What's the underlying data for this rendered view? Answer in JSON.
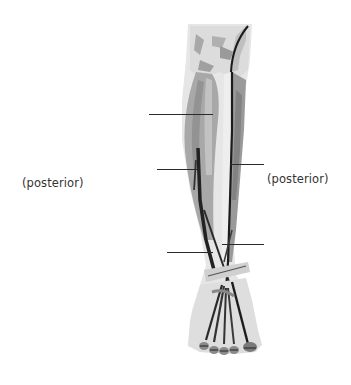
{
  "diagram": {
    "labels": [
      {
        "id": "left",
        "text": "(posterior)"
      },
      {
        "id": "right",
        "text": "(posterior)"
      }
    ],
    "leader_lines": [
      {
        "id": "line-1",
        "side": "left",
        "x1": 149,
        "x2": 213,
        "y": 114
      },
      {
        "id": "line-2",
        "side": "left",
        "x1": 157,
        "x2": 198,
        "y": 169
      },
      {
        "id": "line-3",
        "side": "right",
        "x1": 230,
        "x2": 264,
        "y": 164
      },
      {
        "id": "line-4",
        "side": "right",
        "x1": 222,
        "x2": 264,
        "y": 244
      },
      {
        "id": "line-5",
        "side": "left",
        "x1": 167,
        "x2": 213,
        "y": 252
      }
    ],
    "colors": {
      "background": "#ffffff",
      "line": "#2a2a2a",
      "text": "#333333",
      "muscle_dark": "#555555",
      "muscle_mid": "#9a9a9a",
      "muscle_light": "#d6d6d6"
    }
  }
}
